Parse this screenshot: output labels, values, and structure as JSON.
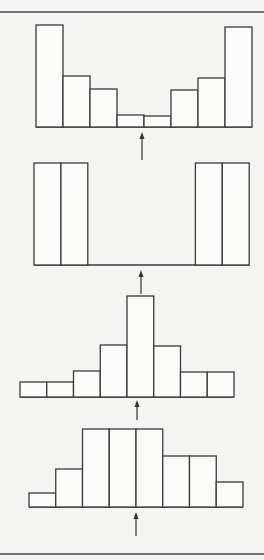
{
  "figure": {
    "colors": {
      "background": "#f4f4f2",
      "bar_fill": "#fbfbf9",
      "stroke": "#3a3a3a"
    },
    "borders": {
      "top_y": 12,
      "bottom_y": 554
    }
  },
  "chart_data": [
    {
      "type": "bar",
      "title": "",
      "panel": 1,
      "shape": "U-shaped (bimodal at extremes)",
      "categories": [
        "1",
        "2",
        "3",
        "4",
        "5",
        "6",
        "7",
        "8"
      ],
      "values": [
        102,
        51,
        38,
        12,
        11,
        37,
        49,
        100
      ],
      "xlabel": "",
      "ylabel": "",
      "grid": false,
      "layout": {
        "x0": 36,
        "bin_width": 27,
        "base_y": 127,
        "arrow_x": 142,
        "arrow_top": 132,
        "arrow_bottom": 160
      }
    },
    {
      "type": "bar",
      "title": "",
      "panel": 2,
      "shape": "extreme bimodal (only outer two bins on each side)",
      "categories": [
        "1",
        "2",
        "3",
        "4",
        "5",
        "6",
        "7",
        "8"
      ],
      "values": [
        102,
        102,
        0,
        0,
        0,
        0,
        102,
        102
      ],
      "xlabel": "",
      "ylabel": "",
      "grid": false,
      "layout": {
        "x0": 34,
        "bin_width": 26.9,
        "base_y": 265,
        "arrow_x": 141,
        "arrow_top": 270,
        "arrow_bottom": 294
      }
    },
    {
      "type": "bar",
      "title": "",
      "panel": 3,
      "shape": "unimodal peaked (leptokurtic)",
      "categories": [
        "1",
        "2",
        "3",
        "4",
        "5",
        "6",
        "7",
        "8"
      ],
      "values": [
        15,
        15,
        26,
        52,
        101,
        51,
        25,
        25
      ],
      "xlabel": "",
      "ylabel": "",
      "grid": false,
      "layout": {
        "x0": 20,
        "bin_width": 26.75,
        "base_y": 397,
        "arrow_x": 137,
        "arrow_top": 400,
        "arrow_bottom": 420
      }
    },
    {
      "type": "bar",
      "title": "",
      "panel": 4,
      "shape": "unimodal flat-topped (platykurtic)",
      "categories": [
        "1",
        "2",
        "3",
        "4",
        "5",
        "6",
        "7",
        "8"
      ],
      "values": [
        14,
        38,
        78,
        78,
        78,
        51,
        51,
        25
      ],
      "xlabel": "",
      "ylabel": "",
      "grid": false,
      "layout": {
        "x0": 29,
        "bin_width": 26.75,
        "base_y": 507,
        "arrow_x": 136,
        "arrow_top": 512,
        "arrow_bottom": 536
      }
    }
  ]
}
